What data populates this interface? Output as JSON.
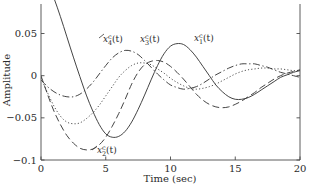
{
  "chart_data": {
    "type": "line",
    "title": "",
    "xlabel": "Time (sec)",
    "ylabel": "Amplitude",
    "xlim": [
      0,
      20
    ],
    "ylim": [
      -0.1,
      0.085
    ],
    "xticks": [
      0,
      5,
      10,
      15,
      20
    ],
    "xticklabels": [
      "0",
      "5",
      "10",
      "15",
      "20"
    ],
    "yticks": [
      0.05,
      0,
      -0.05,
      -0.1
    ],
    "yticklabels": [
      "0.05",
      "0",
      "−0.05",
      "−0.1"
    ],
    "grid": false,
    "legend": "inline-annotations",
    "series": [
      {
        "name": "x_1^c(t)",
        "label": "x1c",
        "linestyle": "solid",
        "color": "#3a3a3a",
        "annotation": "x_1^c(t)",
        "x": [
          0,
          0.5,
          1,
          1.5,
          2,
          2.5,
          3,
          3.5,
          4,
          4.5,
          5,
          5.5,
          6,
          6.5,
          7,
          7.5,
          8,
          8.5,
          9,
          9.5,
          10,
          10.5,
          11,
          11.5,
          12,
          12.5,
          13,
          13.5,
          14,
          14.5,
          15,
          15.5,
          16,
          16.5,
          17,
          17.5,
          18,
          18.5,
          19,
          19.5,
          20
        ],
        "y": [
          0.128,
          0.112,
          0.092,
          0.07,
          0.046,
          0.022,
          -0.001,
          -0.023,
          -0.042,
          -0.058,
          -0.069,
          -0.073,
          -0.072,
          -0.066,
          -0.055,
          -0.04,
          -0.023,
          -0.005,
          0.012,
          0.026,
          0.035,
          0.038,
          0.037,
          0.031,
          0.022,
          0.011,
          0.0,
          -0.011,
          -0.019,
          -0.025,
          -0.028,
          -0.028,
          -0.026,
          -0.022,
          -0.017,
          -0.012,
          -0.007,
          -0.002,
          0.001,
          0.004,
          0.006
        ]
      },
      {
        "name": "x_2^c(t)",
        "label": "x2c",
        "linestyle": "dashed",
        "color": "#3a3a3a",
        "annotation": "x_2^c(t)",
        "x": [
          0,
          0.5,
          1,
          1.5,
          2,
          2.5,
          3,
          3.5,
          4,
          4.5,
          5,
          5.5,
          6,
          6.5,
          7,
          7.5,
          8,
          8.5,
          9,
          9.5,
          10,
          10.5,
          11,
          11.5,
          12,
          12.5,
          13,
          13.5,
          14,
          14.5,
          15,
          15.5,
          16,
          16.5,
          17,
          17.5,
          18,
          18.5,
          19,
          19.5,
          20
        ],
        "y": [
          0.0,
          -0.022,
          -0.042,
          -0.058,
          -0.071,
          -0.08,
          -0.086,
          -0.088,
          -0.087,
          -0.082,
          -0.073,
          -0.06,
          -0.045,
          -0.028,
          -0.01,
          0.004,
          0.013,
          0.017,
          0.018,
          0.016,
          0.011,
          0.004,
          -0.004,
          -0.013,
          -0.022,
          -0.029,
          -0.034,
          -0.037,
          -0.038,
          -0.037,
          -0.034,
          -0.03,
          -0.025,
          -0.02,
          -0.014,
          -0.009,
          -0.004,
          0.0,
          0.003,
          0.005,
          0.007
        ]
      },
      {
        "name": "x_3^c(t)",
        "label": "x3c",
        "linestyle": "dotted",
        "color": "#8d8d8d",
        "annotation": "x_3^c(t)",
        "x": [
          0,
          0.5,
          1,
          1.5,
          2,
          2.5,
          3,
          3.5,
          4,
          4.5,
          5,
          5.5,
          6,
          6.5,
          7,
          7.5,
          8,
          8.5,
          9,
          9.5,
          10,
          10.5,
          11,
          11.5,
          12,
          12.5,
          13,
          13.5,
          14,
          14.5,
          15,
          15.5,
          16,
          16.5,
          17,
          17.5,
          18,
          18.5,
          19,
          19.5,
          20
        ],
        "y": [
          -0.003,
          -0.02,
          -0.036,
          -0.048,
          -0.055,
          -0.057,
          -0.056,
          -0.051,
          -0.044,
          -0.035,
          -0.024,
          -0.013,
          -0.002,
          0.006,
          0.012,
          0.015,
          0.015,
          0.013,
          0.008,
          0.003,
          -0.003,
          -0.008,
          -0.012,
          -0.015,
          -0.016,
          -0.015,
          -0.013,
          -0.01,
          -0.006,
          -0.002,
          0.002,
          0.005,
          0.007,
          0.008,
          0.009,
          0.009,
          0.008,
          0.008,
          0.007,
          0.006,
          0.006
        ]
      },
      {
        "name": "x_4^c(t)",
        "label": "x4c",
        "linestyle": "dashdot",
        "color": "#3a3a3a",
        "annotation": "x_4^c(t)",
        "x": [
          0,
          0.5,
          1,
          1.5,
          2,
          2.5,
          3,
          3.5,
          4,
          4.5,
          5,
          5.5,
          6,
          6.5,
          7,
          7.5,
          8,
          8.5,
          9,
          9.5,
          10,
          10.5,
          11,
          11.5,
          12,
          12.5,
          13,
          13.5,
          14,
          14.5,
          15,
          15.5,
          16,
          16.5,
          17,
          17.5,
          18,
          18.5,
          19,
          19.5,
          20
        ],
        "y": [
          -0.005,
          -0.013,
          -0.019,
          -0.023,
          -0.025,
          -0.025,
          -0.022,
          -0.016,
          -0.008,
          0.002,
          0.012,
          0.021,
          0.027,
          0.03,
          0.029,
          0.025,
          0.018,
          0.01,
          0.002,
          -0.005,
          -0.011,
          -0.014,
          -0.016,
          -0.015,
          -0.013,
          -0.009,
          -0.004,
          0.001,
          0.005,
          0.009,
          0.012,
          0.014,
          0.014,
          0.014,
          0.012,
          0.01,
          0.007,
          0.004,
          0.002,
          0.0,
          -0.002
        ]
      }
    ]
  },
  "axes": {
    "ylabel": "Amplitude",
    "xlabel": "Time (sec)"
  },
  "annotations": [
    {
      "id": "x4c",
      "base": "x",
      "sub": "4",
      "sup": "c",
      "tail": "(t)"
    },
    {
      "id": "x3c",
      "base": "x",
      "sub": "3",
      "sup": "c",
      "tail": "(t)"
    },
    {
      "id": "x1c",
      "base": "x",
      "sub": "1",
      "sup": "c",
      "tail": "(t)"
    },
    {
      "id": "x2c",
      "base": "x",
      "sub": "2",
      "sup": "c",
      "tail": "(t)"
    }
  ]
}
